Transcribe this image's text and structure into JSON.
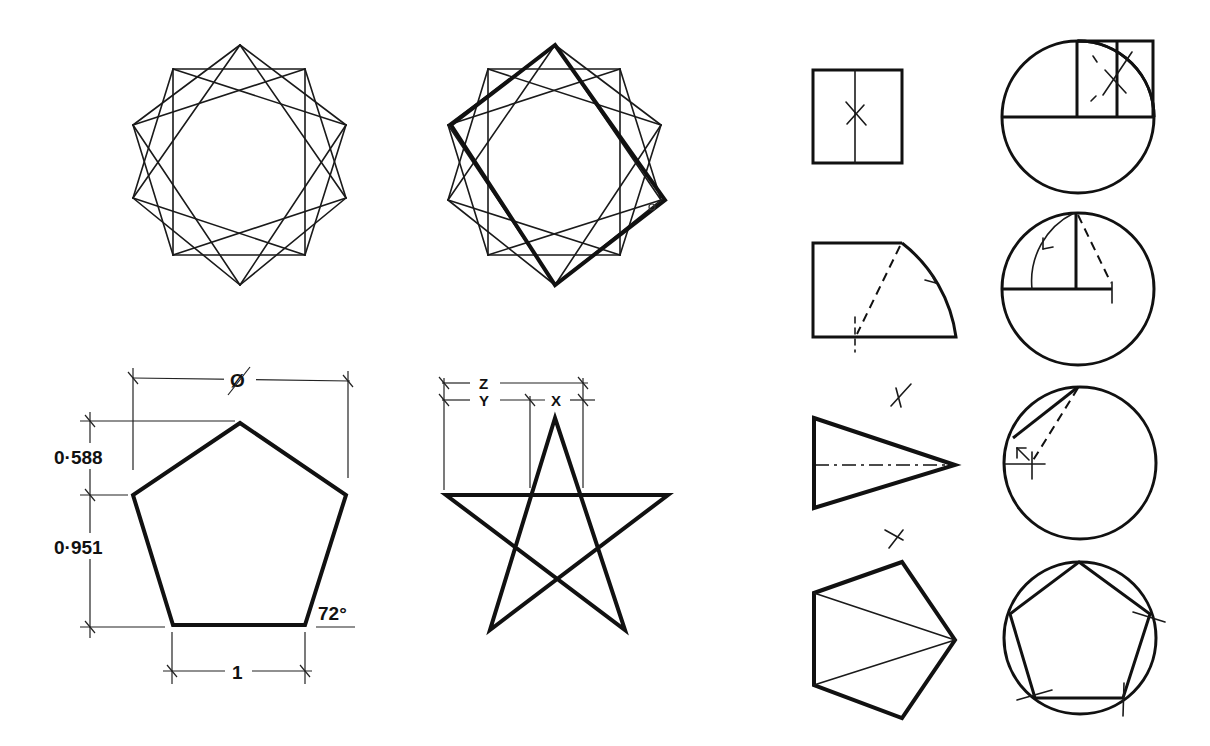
{
  "figure": {
    "background": "#ffffff",
    "ink": "#111111"
  },
  "star10_plain": {
    "vertices": [
      [
        240,
        45
      ],
      [
        305,
        69
      ],
      [
        346,
        125
      ],
      [
        346,
        198
      ],
      [
        305,
        255
      ],
      [
        240,
        285
      ],
      [
        173,
        255
      ],
      [
        133,
        198
      ],
      [
        133,
        125
      ],
      [
        173,
        69
      ]
    ]
  },
  "star10_highlight": {
    "vertices": [
      [
        555,
        45
      ],
      [
        620,
        69
      ],
      [
        661,
        125
      ],
      [
        661,
        200
      ],
      [
        620,
        255
      ],
      [
        555,
        285
      ],
      [
        488,
        255
      ],
      [
        448,
        200
      ],
      [
        448,
        125
      ],
      [
        488,
        69
      ]
    ],
    "bold_rectangle": [
      [
        555,
        45
      ],
      [
        665,
        200
      ],
      [
        555,
        285
      ],
      [
        451,
        125
      ]
    ]
  },
  "pentagon_dimensioned": {
    "vertices": [
      [
        240,
        423
      ],
      [
        346,
        495
      ],
      [
        305,
        625
      ],
      [
        173,
        625
      ],
      [
        133,
        495
      ]
    ],
    "labels": {
      "diameter": "Ø",
      "top_height": "0·588",
      "body_height": "0·951",
      "angle": "72°",
      "side": "1"
    }
  },
  "pentagram": {
    "vertices": [
      [
        555,
        418
      ],
      [
        446,
        495
      ],
      [
        668,
        495
      ],
      [
        490,
        630
      ],
      [
        625,
        630
      ]
    ],
    "labels": {
      "z": "Z",
      "y": "Y",
      "x": "X"
    }
  },
  "construction_steps": {
    "count": 4,
    "step1": {
      "square": [
        812,
        70,
        90,
        93
      ],
      "circle": {
        "cx": 1078,
        "cy": 117,
        "r": 76
      }
    },
    "step2": {
      "circle": {
        "cx": 1078,
        "cy": 289,
        "r": 76
      }
    },
    "step3": {
      "circle": {
        "cx": 1080,
        "cy": 463,
        "r": 76
      }
    },
    "step4": {
      "circle": {
        "cx": 1080,
        "cy": 638,
        "r": 76
      }
    }
  }
}
